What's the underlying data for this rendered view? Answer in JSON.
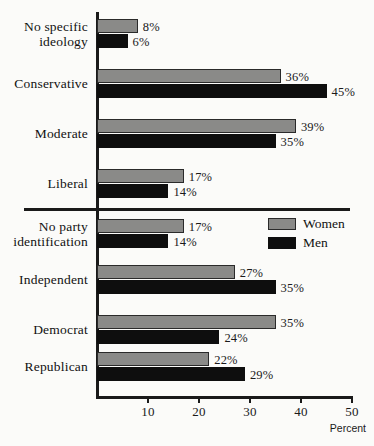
{
  "chart_data": {
    "type": "bar",
    "orientation": "horizontal",
    "title": "",
    "xlabel": "Percent",
    "ylabel": "",
    "xlim": [
      0,
      50
    ],
    "xticks": [
      10,
      20,
      30,
      40,
      50
    ],
    "xtick_labels": [
      "10",
      "20",
      "30",
      "40",
      "50"
    ],
    "grid": false,
    "legend_position": "middle-right",
    "categories": [
      "No specific ideology",
      "Conservative",
      "Moderate",
      "Liberal",
      "No party identification",
      "Independent",
      "Democrat",
      "Republican"
    ],
    "series": [
      {
        "name": "Women",
        "color": "#8a8a88",
        "values": [
          8,
          36,
          39,
          17,
          17,
          27,
          35,
          22
        ]
      },
      {
        "name": "Men",
        "color": "#0e0e0e",
        "values": [
          6,
          45,
          35,
          14,
          14,
          35,
          24,
          29
        ]
      }
    ],
    "value_label_suffix": "%",
    "section_divider_after_category": "Liberal"
  },
  "axis": {
    "x_title": "Percent",
    "ticks": [
      {
        "value": 10,
        "label": "10"
      },
      {
        "value": 20,
        "label": "20"
      },
      {
        "value": 30,
        "label": "30"
      },
      {
        "value": 40,
        "label": "40"
      },
      {
        "value": 50,
        "label": "50"
      }
    ]
  },
  "legend": {
    "items": [
      {
        "label": "Women",
        "color": "#8a8a88"
      },
      {
        "label": "Men",
        "color": "#0e0e0e"
      }
    ]
  },
  "groups": [
    {
      "label_line1": "No specific",
      "label_line2": "ideology",
      "women": {
        "value": 8,
        "label": "8%"
      },
      "men": {
        "value": 6,
        "label": "6%"
      }
    },
    {
      "label_line1": "Conservative",
      "label_line2": "",
      "women": {
        "value": 36,
        "label": "36%"
      },
      "men": {
        "value": 45,
        "label": "45%"
      }
    },
    {
      "label_line1": "Moderate",
      "label_line2": "",
      "women": {
        "value": 39,
        "label": "39%"
      },
      "men": {
        "value": 35,
        "label": "35%"
      }
    },
    {
      "label_line1": "Liberal",
      "label_line2": "",
      "women": {
        "value": 17,
        "label": "17%"
      },
      "men": {
        "value": 14,
        "label": "14%"
      }
    },
    {
      "label_line1": "No party",
      "label_line2": "identification",
      "women": {
        "value": 17,
        "label": "17%"
      },
      "men": {
        "value": 14,
        "label": "14%"
      }
    },
    {
      "label_line1": "Independent",
      "label_line2": "",
      "women": {
        "value": 27,
        "label": "27%"
      },
      "men": {
        "value": 35,
        "label": "35%"
      }
    },
    {
      "label_line1": "Democrat",
      "label_line2": "",
      "women": {
        "value": 35,
        "label": "35%"
      },
      "men": {
        "value": 24,
        "label": "24%"
      }
    },
    {
      "label_line1": "Republican",
      "label_line2": "",
      "women": {
        "value": 22,
        "label": "22%"
      },
      "men": {
        "value": 29,
        "label": "29%"
      }
    }
  ]
}
